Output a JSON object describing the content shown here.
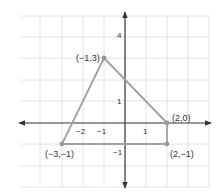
{
  "figure": {
    "type": "coordinate-plane-polygon",
    "axes": {
      "x_ticks": [
        {
          "value": -2,
          "label": "−2"
        },
        {
          "value": -1,
          "label": "−1"
        },
        {
          "value": 1,
          "label": "1"
        }
      ],
      "y_ticks": [
        {
          "value": 4,
          "label": "4"
        },
        {
          "value": 1,
          "label": "1"
        },
        {
          "value": -1,
          "label": "−1"
        }
      ]
    },
    "vertices": [
      {
        "x": -1,
        "y": 3,
        "label": "(−1,3)"
      },
      {
        "x": 2,
        "y": 0,
        "label": "(2,0)"
      },
      {
        "x": 2,
        "y": -1,
        "label": "(2,−1)"
      },
      {
        "x": -3,
        "y": -1,
        "label": "(−3,−1)"
      }
    ],
    "colors": {
      "grid": "#e2e2e2",
      "axis": "#333333",
      "shape": "#a0a0a0",
      "point": "#9a9a9a"
    }
  }
}
